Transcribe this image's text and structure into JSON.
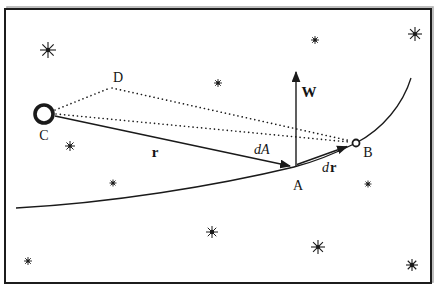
{
  "figure": {
    "background": "#ffffff",
    "ink": "#1a1a1a",
    "shadow": "#b0b0b0",
    "labels": {
      "C": "C",
      "D": "D",
      "A": "A",
      "B": "B",
      "r": "r",
      "W": "W",
      "dA": "dA",
      "dr_d": "d",
      "dr_r": "r"
    },
    "stars": [
      {
        "x": 48,
        "y": 50,
        "r": 8,
        "dot": 2.2,
        "sw": 1.1
      },
      {
        "x": 315,
        "y": 40,
        "r": 4,
        "dot": 1.8,
        "sw": 0.9
      },
      {
        "x": 415,
        "y": 34,
        "r": 7,
        "dot": 2.0,
        "sw": 1.1
      },
      {
        "x": 218,
        "y": 83,
        "r": 4,
        "dot": 1.8,
        "sw": 0.9
      },
      {
        "x": 70,
        "y": 146,
        "r": 5,
        "dot": 1.8,
        "sw": 1.0
      },
      {
        "x": 113,
        "y": 183,
        "r": 3.5,
        "dot": 1.6,
        "sw": 0.9
      },
      {
        "x": 212,
        "y": 232,
        "r": 6,
        "dot": 2.2,
        "sw": 1.0
      },
      {
        "x": 28,
        "y": 261,
        "r": 4,
        "dot": 1.6,
        "sw": 0.9
      },
      {
        "x": 368,
        "y": 184,
        "r": 3.5,
        "dot": 1.6,
        "sw": 0.9
      },
      {
        "x": 318,
        "y": 247,
        "r": 7,
        "dot": 2.0,
        "sw": 1.1
      },
      {
        "x": 412,
        "y": 265,
        "r": 6,
        "dot": 2.2,
        "sw": 1.1
      }
    ]
  }
}
